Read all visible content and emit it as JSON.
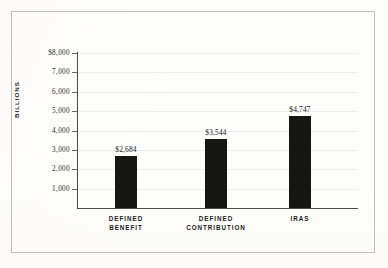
{
  "chart_data": {
    "type": "bar",
    "title": "",
    "subtitle": "",
    "xlabel": "",
    "ylabel": "BILLIONS",
    "categories": [
      "DEFINED BENEFIT",
      "DEFINED CONTRIBUTION",
      "IRAS"
    ],
    "category_lines": [
      [
        "DEFINED",
        "BENEFIT"
      ],
      [
        "DEFINED",
        "CONTRIBUTION"
      ],
      [
        "IRAS"
      ]
    ],
    "values": [
      2684,
      3544,
      4747
    ],
    "value_labels": [
      "$2,684",
      "$3,544",
      "$4,747"
    ],
    "ylim": [
      0,
      8000
    ],
    "ytick_values": [
      1000,
      2000,
      3000,
      4000,
      5000,
      6000,
      7000,
      8000
    ],
    "ytick_labels": [
      "1,000",
      "2,000",
      "3,000",
      "4,000",
      "5,000",
      "6,000",
      "7,000",
      "$8,000"
    ],
    "grid": true,
    "legend": "none",
    "bar_color": "#161614",
    "grid_color": "#eeeeec",
    "axis_color": "#4a4a48",
    "background_color": "#fdfdfc",
    "frame_color": "#bfbfbd"
  }
}
